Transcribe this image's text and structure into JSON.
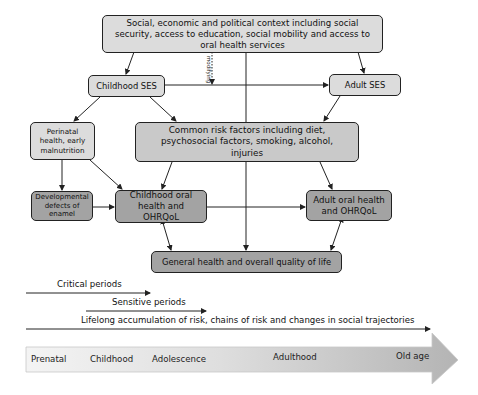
{
  "diagram": {
    "nodes": {
      "context": "Social, economic and political context including social security, access to education, social mobility and access to oral health services",
      "childhood_ses": "Childhood SES",
      "adult_ses": "Adult SES",
      "perinatal": "Perinatal health, early malnutrition",
      "common_risk": "Common risk factors including diet, psychosocial factors, smoking, alcohol, injuries",
      "developmental": "Developmental defects of enamel",
      "childhood_oral": "Childhood oral health and OHRQoL",
      "adult_oral": "Adult oral health and OHRQoL",
      "general_health": "General health and overall quality of life"
    },
    "modifying_label": "modifying",
    "periods": {
      "critical": "Critical periods",
      "sensitive": "Sensitive periods",
      "lifelong": "Lifelong accumulation of risk, chains of risk and changes in social trajectories"
    },
    "life_stages": [
      "Prenatal",
      "Childhood",
      "Adolescence",
      "Adulthood",
      "Old age"
    ],
    "colors": {
      "light_box": "#dcdcdc",
      "mid_box": "#c9c9c9",
      "dark_box": "#a3a3a3",
      "border": "#222222"
    }
  }
}
